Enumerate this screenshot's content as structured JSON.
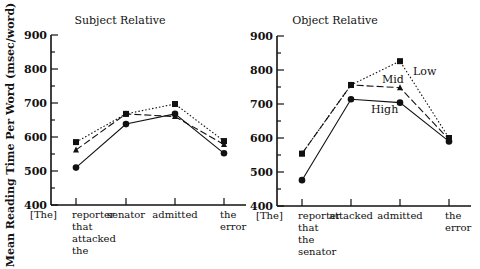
{
  "y_axis_label": "Mean Reading Time Per Word (msec/word)",
  "chart_data": [
    {
      "type": "line",
      "title": "Subject Relative",
      "ylabel": "Mean Reading Time Per Word (msec/word)",
      "xlabel": "",
      "ylim": [
        400,
        900
      ],
      "yticks": [
        400,
        500,
        600,
        700,
        800,
        900
      ],
      "grid": false,
      "categories": [
        "reporter that attacked the",
        "senator",
        "admitted",
        "the error"
      ],
      "category_lines": [
        [
          "reporter",
          "that",
          "attacked",
          "the"
        ],
        [
          "senator"
        ],
        [
          "admitted"
        ],
        [
          "the",
          "error"
        ]
      ],
      "prefix_label": "[The]",
      "series": [
        {
          "name": "Low",
          "marker": "square",
          "line": "dotted",
          "values": [
            585,
            668,
            697,
            588
          ]
        },
        {
          "name": "Mid",
          "marker": "triangle",
          "line": "dashed",
          "values": [
            562,
            668,
            660,
            578
          ]
        },
        {
          "name": "High",
          "marker": "circle",
          "line": "solid",
          "values": [
            510,
            638,
            668,
            552
          ]
        }
      ]
    },
    {
      "type": "line",
      "title": "Object Relative",
      "ylabel": "",
      "xlabel": "",
      "ylim": [
        400,
        900
      ],
      "yticks": [
        400,
        500,
        600,
        700,
        800,
        900
      ],
      "grid": false,
      "categories": [
        "reporter that the senator",
        "attacked",
        "admitted",
        "the error"
      ],
      "category_lines": [
        [
          "reporter",
          "that",
          "the",
          "senator"
        ],
        [
          "attacked"
        ],
        [
          "admitted"
        ],
        [
          "the",
          "error"
        ]
      ],
      "prefix_label": "[The]",
      "legend_annotations": [
        "Low",
        "Mid",
        "High"
      ],
      "series": [
        {
          "name": "Low",
          "marker": "square",
          "line": "dotted",
          "values": [
            554,
            756,
            826,
            600
          ]
        },
        {
          "name": "Mid",
          "marker": "triangle",
          "line": "dashed",
          "values": [
            554,
            756,
            748,
            596
          ]
        },
        {
          "name": "High",
          "marker": "circle",
          "line": "solid",
          "values": [
            476,
            714,
            704,
            590
          ]
        }
      ]
    }
  ]
}
